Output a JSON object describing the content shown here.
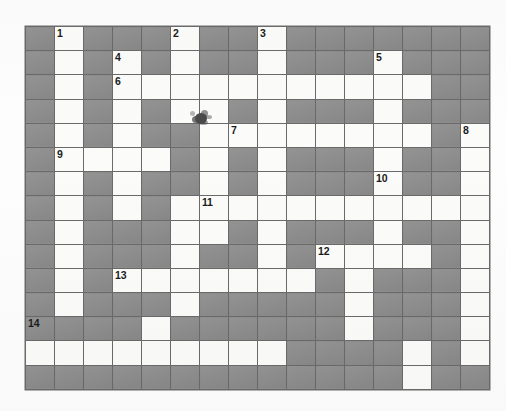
{
  "puzzle": {
    "kind": "crossword-grid",
    "rows": 15,
    "cols": 16,
    "cell_size_px": 29,
    "colors": {
      "block_fill": "#8e8e8e",
      "open_fill": "#fbfbfa",
      "grid_line": "#6a6a6a",
      "number_text": "#1b1b1b",
      "page_background": "#fdfdfd"
    },
    "legend": {
      "open": "white answer cell",
      "block": "shaded blocked cell"
    },
    "clue_numbers": [
      {
        "n": "1",
        "row": 1,
        "col": 2
      },
      {
        "n": "2",
        "row": 1,
        "col": 6
      },
      {
        "n": "3",
        "row": 1,
        "col": 9
      },
      {
        "n": "4",
        "row": 2,
        "col": 4
      },
      {
        "n": "5",
        "row": 2,
        "col": 13
      },
      {
        "n": "6",
        "row": 3,
        "col": 4
      },
      {
        "n": "7",
        "row": 5,
        "col": 8
      },
      {
        "n": "8",
        "row": 5,
        "col": 16
      },
      {
        "n": "9",
        "row": 6,
        "col": 2
      },
      {
        "n": "10",
        "row": 7,
        "col": 13
      },
      {
        "n": "11",
        "row": 8,
        "col": 7
      },
      {
        "n": "12",
        "row": 10,
        "col": 11
      },
      {
        "n": "13",
        "row": 11,
        "col": 4
      },
      {
        "n": "14",
        "row": 13,
        "col": 1
      }
    ],
    "grid": [
      [
        0,
        1,
        0,
        0,
        0,
        1,
        0,
        0,
        1,
        0,
        0,
        0,
        0,
        0,
        0,
        0
      ],
      [
        0,
        1,
        0,
        1,
        0,
        1,
        0,
        0,
        1,
        0,
        0,
        0,
        1,
        0,
        0,
        0
      ],
      [
        0,
        1,
        0,
        1,
        1,
        1,
        1,
        1,
        1,
        1,
        1,
        1,
        1,
        1,
        0,
        0
      ],
      [
        0,
        1,
        0,
        1,
        0,
        1,
        1,
        0,
        1,
        0,
        0,
        0,
        1,
        0,
        0,
        0
      ],
      [
        0,
        1,
        0,
        1,
        0,
        0,
        1,
        1,
        1,
        1,
        1,
        1,
        1,
        1,
        0,
        1
      ],
      [
        0,
        1,
        1,
        1,
        1,
        0,
        1,
        0,
        1,
        0,
        0,
        0,
        1,
        0,
        0,
        1
      ],
      [
        0,
        1,
        0,
        1,
        0,
        0,
        1,
        0,
        1,
        0,
        0,
        0,
        1,
        0,
        0,
        1
      ],
      [
        0,
        1,
        0,
        1,
        0,
        1,
        1,
        1,
        1,
        1,
        1,
        1,
        1,
        1,
        1,
        1
      ],
      [
        0,
        1,
        0,
        0,
        0,
        1,
        1,
        0,
        1,
        0,
        0,
        0,
        1,
        0,
        0,
        1
      ],
      [
        0,
        1,
        0,
        0,
        0,
        1,
        0,
        0,
        1,
        0,
        1,
        1,
        1,
        1,
        0,
        1
      ],
      [
        0,
        1,
        0,
        1,
        1,
        1,
        1,
        1,
        1,
        1,
        0,
        1,
        0,
        0,
        0,
        1
      ],
      [
        0,
        1,
        0,
        0,
        0,
        1,
        0,
        0,
        0,
        0,
        0,
        1,
        0,
        0,
        0,
        1
      ],
      [
        0,
        0,
        0,
        0,
        1,
        0,
        0,
        0,
        0,
        0,
        0,
        1,
        0,
        0,
        0,
        1
      ],
      [
        1,
        1,
        1,
        1,
        1,
        1,
        1,
        1,
        1,
        0,
        0,
        0,
        0,
        1,
        0,
        1
      ],
      [
        0,
        0,
        0,
        0,
        0,
        0,
        0,
        0,
        0,
        0,
        0,
        0,
        0,
        1,
        0,
        0
      ]
    ]
  }
}
